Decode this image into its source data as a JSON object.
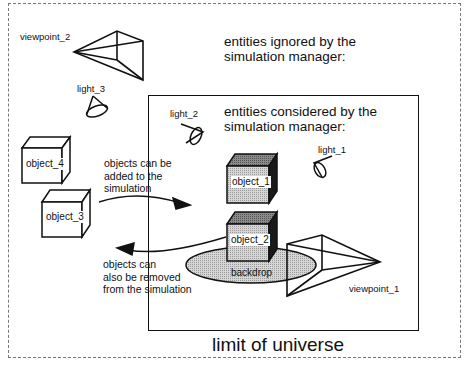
{
  "diagram": {
    "type": "conceptual scene diagram",
    "headings": {
      "ignored": "entities ignored by the simulation manager:",
      "ignored_line1": "entities ignored by the",
      "ignored_line2": "simulation manager:",
      "considered_line1": "entities considered by the",
      "considered_line2": "simulation manager:"
    },
    "universe_label": "limit of universe",
    "notes": {
      "added_line1": "objects can be",
      "added_line2": "added to the",
      "added_line3": "simulation",
      "removed_line1": "objects can",
      "removed_line2": "also be removed",
      "removed_line3": "from the simulation"
    },
    "entities_ignored": [
      {
        "name": "viewpoint_2",
        "kind": "viewpoint"
      },
      {
        "name": "light_3",
        "kind": "light"
      },
      {
        "name": "object_4",
        "kind": "object"
      },
      {
        "name": "object_3",
        "kind": "object"
      }
    ],
    "entities_considered": [
      {
        "name": "light_2",
        "kind": "light"
      },
      {
        "name": "light_1",
        "kind": "light"
      },
      {
        "name": "object_1",
        "kind": "object"
      },
      {
        "name": "object_2",
        "kind": "object"
      },
      {
        "name": "backdrop",
        "kind": "backdrop"
      },
      {
        "name": "viewpoint_1",
        "kind": "viewpoint"
      }
    ],
    "labels": {
      "viewpoint_2": "viewpoint_2",
      "light_3": "light_3",
      "object_4": "object_4",
      "object_3": "object_3",
      "light_2": "light_2",
      "light_1": "light_1",
      "object_1": "object_1",
      "object_2": "object_2",
      "backdrop": "backdrop",
      "viewpoint_1": "viewpoint_1"
    },
    "colors": {
      "line": "#111111",
      "fill_gray": "#b8b8b8",
      "fill_dark": "#1a1a1a",
      "backdrop_fill": "#cfcfcf",
      "border_dashed": "#777777"
    }
  }
}
